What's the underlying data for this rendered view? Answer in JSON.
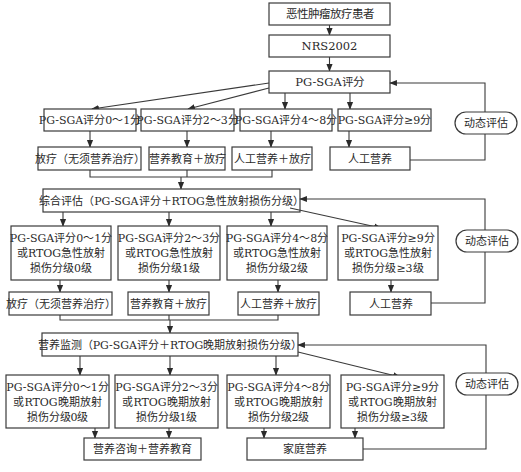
{
  "flowchart": {
    "start": "恶性肿瘤放疗患者",
    "screening": "NRS2002",
    "stage1": {
      "assessment": "PG-SGA评分",
      "grades": [
        "PG-SGA评分0～1分",
        "PG-SGA评分2～3分",
        "PG-SGA评分4～8分",
        "PG-SGA评分≥9分"
      ],
      "actions": [
        "放疗（无须营养治疗）",
        "营养教育＋放疗",
        "人工营养＋放疗",
        "人工营养"
      ],
      "feedback": "动态评估"
    },
    "stage2": {
      "assessment": "综合评估（PG-SGA评分＋RTOG急性放射损伤分级）",
      "grades": [
        [
          "PG-SGA评分0～1分",
          "或RTOG急性放射",
          "损伤分级0级"
        ],
        [
          "PG-SGA评分2～3分",
          "或RTOG急性放射",
          "损伤分级1级"
        ],
        [
          "PG-SGA评分4～8分",
          "或RTOG急性放射",
          "损伤分级2级"
        ],
        [
          "PG-SGA评分≥9分",
          "或RTOG急性放射",
          "损伤分级≥3级"
        ]
      ],
      "actions": [
        "放疗（无须营养治疗）",
        "营养教育＋放疗",
        "人工营养＋放疗",
        "人工营养"
      ],
      "feedback": "动态评估"
    },
    "stage3": {
      "assessment": "营养监测（PG-SGA评分＋RTOG晚期放射损伤分级）",
      "grades": [
        [
          "PG-SGA评分0～1分",
          "或RTOG晚期放射",
          "损伤分级0级"
        ],
        [
          "PG-SGA评分2～3分",
          "或RTOG晚期放射",
          "损伤分级1级"
        ],
        [
          "PG-SGA评分4～8分",
          "或RTOG晚期放射",
          "损伤分级2级"
        ],
        [
          "PG-SGA评分≥9分",
          "或RTOG晚期放射",
          "损伤分级≥3级"
        ]
      ],
      "actions": [
        "营养咨询＋营养教育",
        "家庭营养"
      ],
      "feedback": "动态评估"
    }
  }
}
